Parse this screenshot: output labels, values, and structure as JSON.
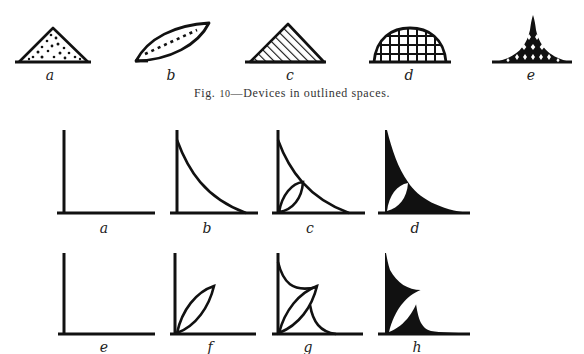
{
  "caption": {
    "prefix": "Fig.",
    "number": "10",
    "text": "—Devices in outlined spaces."
  },
  "caption_full": "Fig. 10—Devices in outlined spaces.",
  "top_row": {
    "figures": [
      {
        "label": "a",
        "description": "triangle filled with dots"
      },
      {
        "label": "b",
        "description": "lens/leaf shape with dashed center line"
      },
      {
        "label": "c",
        "description": "triangle filled with diagonal hatching"
      },
      {
        "label": "d",
        "description": "dome filled with grid"
      },
      {
        "label": "e",
        "description": "concave-sided peak, solid black with white diamond openings"
      }
    ]
  },
  "middle_row": {
    "figures": [
      {
        "label": "a",
        "description": "right-angle axes"
      },
      {
        "label": "b",
        "description": "axes with concave curve"
      },
      {
        "label": "c",
        "description": "axes with concave curve and inscribed lens"
      },
      {
        "label": "d",
        "description": "solid black concave region with white lens"
      }
    ]
  },
  "bottom_row": {
    "figures": [
      {
        "label": "e",
        "description": "right-angle axes"
      },
      {
        "label": "f",
        "description": "axes with diagonal lens"
      },
      {
        "label": "g",
        "description": "axes with lens and two concave arcs"
      },
      {
        "label": "h",
        "description": "solid black region with white lens"
      }
    ]
  },
  "colors": {
    "ink": "#111111",
    "paper": "#ffffff"
  }
}
